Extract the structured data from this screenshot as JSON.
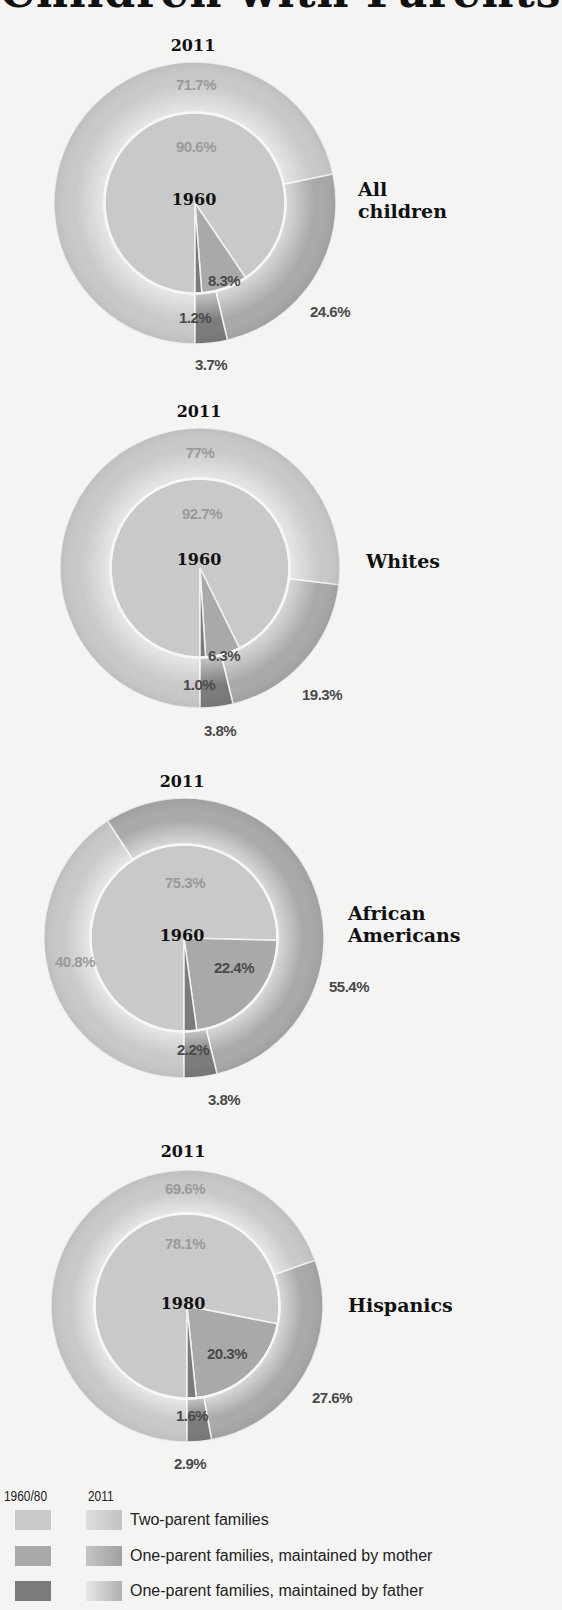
{
  "title": "Children with Parents",
  "colors": {
    "two_parent": "#c9c9c9",
    "mother": "#a9a9a9",
    "father": "#7b7b7b",
    "separator": "#f2f2f2",
    "label_light": "#9a9a9a",
    "label_dark": "#4a4a4a",
    "background": "#f4f4f3"
  },
  "charts": [
    {
      "group": "All\nchildren",
      "outer_year": "2011",
      "inner_year": "1960",
      "inner": {
        "two_parent": "90.6%",
        "mother": "8.3%",
        "father": "1.2%"
      },
      "outer": {
        "two_parent": "71.7%",
        "mother": "24.6%",
        "father": "3.7%"
      }
    },
    {
      "group": "Whites",
      "outer_year": "2011",
      "inner_year": "1960",
      "inner": {
        "two_parent": "92.7%",
        "mother": "6.3%",
        "father": "1.0%"
      },
      "outer": {
        "two_parent": "77%",
        "mother": "19.3%",
        "father": "3.8%"
      }
    },
    {
      "group": "African\nAmericans",
      "outer_year": "2011",
      "inner_year": "1960",
      "inner": {
        "two_parent": "75.3%",
        "mother": "22.4%",
        "father": "2.2%"
      },
      "outer": {
        "two_parent": "40.8%",
        "mother": "55.4%",
        "father": "3.8%"
      }
    },
    {
      "group": "Hispanics",
      "outer_year": "2011",
      "inner_year": "1980",
      "inner": {
        "two_parent": "78.1%",
        "mother": "20.3%",
        "father": "1.6%"
      },
      "outer": {
        "two_parent": "69.6%",
        "mother": "27.6%",
        "father": "2.9%"
      }
    }
  ],
  "legend": {
    "col1_header": "1960/80",
    "col2_header": "2011",
    "items": [
      {
        "key": "two_parent",
        "label": "Two-parent families"
      },
      {
        "key": "mother",
        "label": "One-parent families, maintained by mother"
      },
      {
        "key": "father",
        "label": "One-parent families, maintained by father"
      }
    ]
  },
  "chart_data": [
    {
      "type": "pie",
      "title": "All children",
      "categories": [
        "Two-parent families",
        "One-parent families, maintained by mother",
        "One-parent families, maintained by father"
      ],
      "series": [
        {
          "name": "1960",
          "values": [
            90.6,
            8.3,
            1.2
          ]
        },
        {
          "name": "2011",
          "values": [
            71.7,
            24.6,
            3.7
          ]
        }
      ]
    },
    {
      "type": "pie",
      "title": "Whites",
      "categories": [
        "Two-parent families",
        "One-parent families, maintained by mother",
        "One-parent families, maintained by father"
      ],
      "series": [
        {
          "name": "1960",
          "values": [
            92.7,
            6.3,
            1.0
          ]
        },
        {
          "name": "2011",
          "values": [
            77.0,
            19.3,
            3.8
          ]
        }
      ]
    },
    {
      "type": "pie",
      "title": "African Americans",
      "categories": [
        "Two-parent families",
        "One-parent families, maintained by mother",
        "One-parent families, maintained by father"
      ],
      "series": [
        {
          "name": "1960",
          "values": [
            75.3,
            22.4,
            2.2
          ]
        },
        {
          "name": "2011",
          "values": [
            40.8,
            55.4,
            3.8
          ]
        }
      ]
    },
    {
      "type": "pie",
      "title": "Hispanics",
      "categories": [
        "Two-parent families",
        "One-parent families, maintained by mother",
        "One-parent families, maintained by father"
      ],
      "series": [
        {
          "name": "1980",
          "values": [
            78.1,
            20.3,
            1.6
          ]
        },
        {
          "name": "2011",
          "values": [
            69.6,
            27.6,
            2.9
          ]
        }
      ]
    }
  ]
}
